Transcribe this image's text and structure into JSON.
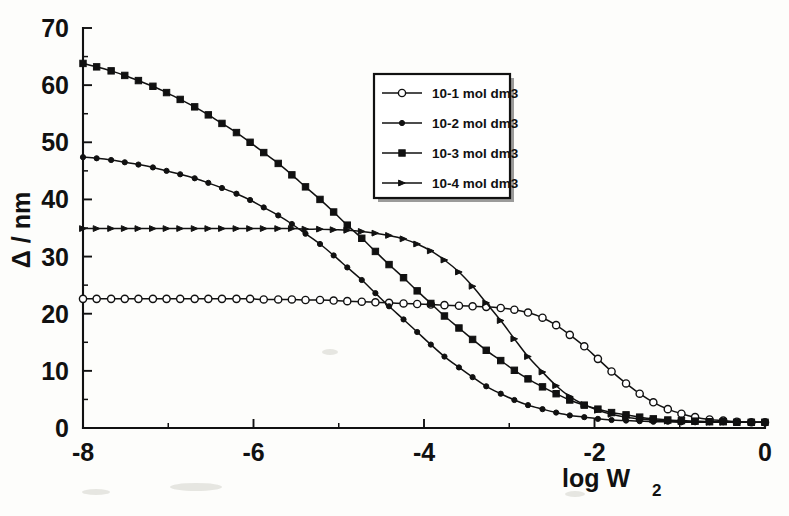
{
  "chart_data": {
    "type": "line",
    "title": "",
    "xlabel": "log W2",
    "xlabel_main": "log W",
    "xlabel_sub": "2",
    "ylabel": "Δ / nm",
    "xlim": [
      -8,
      0
    ],
    "ylim": [
      0,
      70
    ],
    "xticks": [
      -8,
      -6,
      -4,
      -2,
      0
    ],
    "xticklabels": [
      "-8",
      "-6",
      "-4",
      "-2",
      "0"
    ],
    "yticks": [
      0,
      10,
      20,
      30,
      40,
      50,
      60,
      70
    ],
    "yticklabels": [
      "0",
      "10",
      "20",
      "30",
      "40",
      "50",
      "60",
      "70"
    ],
    "x_minor_step": 1,
    "y_minor_step": 5,
    "grid": false,
    "legend_position": "upper-center-right",
    "series": [
      {
        "name": "10-1 mol dm3",
        "marker": "open-circle",
        "color": "#111111",
        "x": [
          -8.0,
          -7.84,
          -7.67,
          -7.51,
          -7.35,
          -7.18,
          -7.02,
          -6.86,
          -6.69,
          -6.53,
          -6.37,
          -6.2,
          -6.04,
          -5.88,
          -5.71,
          -5.55,
          -5.39,
          -5.22,
          -5.06,
          -4.9,
          -4.73,
          -4.57,
          -4.41,
          -4.24,
          -4.08,
          -3.92,
          -3.76,
          -3.59,
          -3.43,
          -3.27,
          -3.1,
          -2.94,
          -2.78,
          -2.61,
          -2.45,
          -2.29,
          -2.12,
          -1.96,
          -1.8,
          -1.63,
          -1.47,
          -1.31,
          -1.14,
          -0.98,
          -0.82,
          -0.65,
          -0.49,
          -0.33,
          -0.16,
          0.0
        ],
        "y": [
          22.6,
          22.6,
          22.6,
          22.6,
          22.6,
          22.6,
          22.6,
          22.6,
          22.6,
          22.6,
          22.6,
          22.6,
          22.6,
          22.5,
          22.5,
          22.5,
          22.4,
          22.4,
          22.3,
          22.2,
          22.1,
          22.0,
          21.9,
          21.8,
          21.7,
          21.6,
          21.5,
          21.4,
          21.3,
          21.2,
          21.0,
          20.7,
          20.2,
          19.3,
          18.0,
          16.3,
          14.3,
          12.1,
          9.9,
          7.8,
          6.0,
          4.5,
          3.3,
          2.5,
          1.9,
          1.5,
          1.3,
          1.1,
          1.0,
          1.0
        ]
      },
      {
        "name": "10-2 mol dm3",
        "marker": "small-filled-circle",
        "color": "#111111",
        "x": [
          -8.0,
          -7.84,
          -7.67,
          -7.51,
          -7.35,
          -7.18,
          -7.02,
          -6.86,
          -6.69,
          -6.53,
          -6.37,
          -6.2,
          -6.04,
          -5.88,
          -5.71,
          -5.55,
          -5.39,
          -5.22,
          -5.06,
          -4.9,
          -4.73,
          -4.57,
          -4.41,
          -4.24,
          -4.08,
          -3.92,
          -3.76,
          -3.59,
          -3.43,
          -3.27,
          -3.1,
          -2.94,
          -2.78,
          -2.61,
          -2.45,
          -2.29,
          -2.12,
          -1.96,
          -1.8,
          -1.63,
          -1.47,
          -1.31,
          -1.14,
          -0.98,
          -0.82,
          -0.65,
          -0.49,
          -0.33,
          -0.16,
          0.0
        ],
        "y": [
          47.4,
          47.2,
          46.9,
          46.5,
          46.1,
          45.6,
          45.0,
          44.4,
          43.7,
          42.9,
          42.0,
          41.0,
          39.9,
          38.6,
          37.2,
          35.7,
          34.0,
          32.2,
          30.2,
          28.1,
          25.9,
          23.6,
          21.3,
          19.0,
          16.8,
          14.6,
          12.5,
          10.6,
          8.9,
          7.3,
          6.0,
          4.9,
          4.0,
          3.3,
          2.7,
          2.2,
          1.9,
          1.6,
          1.4,
          1.3,
          1.2,
          1.1,
          1.1,
          1.0,
          1.0,
          1.0,
          1.0,
          1.0,
          1.0,
          1.0
        ]
      },
      {
        "name": "10-3 mol dm3",
        "marker": "filled-square",
        "color": "#111111",
        "x": [
          -8.0,
          -7.84,
          -7.67,
          -7.51,
          -7.35,
          -7.18,
          -7.02,
          -6.86,
          -6.69,
          -6.53,
          -6.37,
          -6.2,
          -6.04,
          -5.88,
          -5.71,
          -5.55,
          -5.39,
          -5.22,
          -5.06,
          -4.9,
          -4.73,
          -4.57,
          -4.41,
          -4.24,
          -4.08,
          -3.92,
          -3.76,
          -3.59,
          -3.43,
          -3.27,
          -3.1,
          -2.94,
          -2.78,
          -2.61,
          -2.45,
          -2.29,
          -2.12,
          -1.96,
          -1.8,
          -1.63,
          -1.47,
          -1.31,
          -1.14,
          -0.98,
          -0.82,
          -0.65,
          -0.49,
          -0.33,
          -0.16,
          0.0
        ],
        "y": [
          63.8,
          63.2,
          62.5,
          61.7,
          60.8,
          59.8,
          58.7,
          57.5,
          56.2,
          54.8,
          53.3,
          51.7,
          50.0,
          48.2,
          46.3,
          44.3,
          42.2,
          40.0,
          37.8,
          35.5,
          33.2,
          30.9,
          28.6,
          26.3,
          24.0,
          21.8,
          19.6,
          17.5,
          15.5,
          13.6,
          11.8,
          10.1,
          8.6,
          7.2,
          6.0,
          4.9,
          4.0,
          3.3,
          2.7,
          2.3,
          1.9,
          1.6,
          1.4,
          1.3,
          1.2,
          1.1,
          1.1,
          1.0,
          1.0,
          1.0
        ]
      },
      {
        "name": "10-4 mol dm3",
        "marker": "small-arrow",
        "color": "#111111",
        "x": [
          -8.0,
          -7.84,
          -7.67,
          -7.51,
          -7.35,
          -7.18,
          -7.02,
          -6.86,
          -6.69,
          -6.53,
          -6.37,
          -6.2,
          -6.04,
          -5.88,
          -5.71,
          -5.55,
          -5.39,
          -5.22,
          -5.06,
          -4.9,
          -4.73,
          -4.57,
          -4.41,
          -4.24,
          -4.08,
          -3.92,
          -3.76,
          -3.59,
          -3.43,
          -3.27,
          -3.1,
          -2.94,
          -2.78,
          -2.61,
          -2.45,
          -2.29,
          -2.12,
          -1.96,
          -1.8,
          -1.63,
          -1.47,
          -1.31,
          -1.14,
          -0.98,
          -0.82,
          -0.65,
          -0.49,
          -0.33,
          -0.16,
          0.0
        ],
        "y": [
          34.9,
          34.9,
          34.9,
          34.9,
          34.9,
          34.9,
          34.9,
          34.9,
          34.9,
          34.9,
          34.9,
          34.9,
          34.9,
          34.9,
          34.9,
          34.9,
          34.8,
          34.8,
          34.7,
          34.6,
          34.4,
          34.1,
          33.7,
          33.1,
          32.2,
          31.0,
          29.4,
          27.3,
          24.8,
          21.9,
          18.8,
          15.6,
          12.5,
          9.8,
          7.4,
          5.5,
          4.1,
          3.1,
          2.4,
          1.9,
          1.6,
          1.4,
          1.2,
          1.1,
          1.1,
          1.0,
          1.0,
          1.0,
          1.0,
          1.0
        ]
      }
    ]
  },
  "legend": {
    "entries": [
      {
        "label": "10-1 mol dm3",
        "marker": "open-circle"
      },
      {
        "label": "10-2 mol dm3",
        "marker": "small-filled-circle"
      },
      {
        "label": "10-3 mol dm3",
        "marker": "filled-square"
      },
      {
        "label": "10-4 mol dm3",
        "marker": "small-arrow"
      }
    ]
  }
}
